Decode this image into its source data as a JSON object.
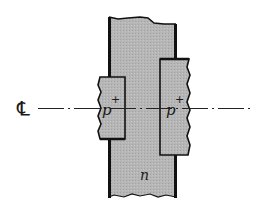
{
  "diagram": {
    "type": "semiconductor-cross-section",
    "centerline": {
      "symbol": "℄",
      "label": "centerline"
    },
    "regions": [
      {
        "id": "n-region",
        "label": "n",
        "fill": "#b4b4b4"
      },
      {
        "id": "left-p-plus",
        "label": "p",
        "superscript": "+",
        "fill": "#b8b8b8"
      },
      {
        "id": "right-p-plus",
        "label": "p",
        "superscript": "+",
        "fill": "#b8b8b8"
      }
    ],
    "colors": {
      "outline": "#111111",
      "background": "#ffffff"
    }
  }
}
